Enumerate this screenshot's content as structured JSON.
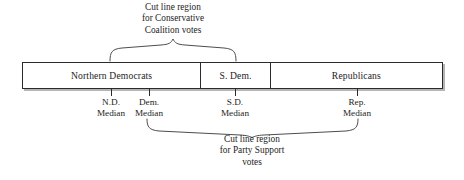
{
  "figure": {
    "type": "legislative-chamber-diagram",
    "background_color": "#ffffff",
    "line_color": "#2b2b2b",
    "brace_color": "#4d4d4d"
  },
  "captions": {
    "top": {
      "lines": [
        "Cut line region",
        "for Conservative",
        "Coalition votes"
      ],
      "brace": {
        "start_x": 110,
        "end_x": 236,
        "apex_x": 173,
        "direction": "down"
      }
    },
    "bottom": {
      "lines": [
        "Cut line region",
        "for Party Support",
        "votes"
      ],
      "brace": {
        "start_x": 147,
        "end_x": 358,
        "apex_x": 252,
        "direction": "up"
      }
    }
  },
  "bar": {
    "left_x": 22,
    "right_x": 443,
    "top_y": 62,
    "bottom_y": 89,
    "segments": [
      {
        "label": "Northern Democrats",
        "start_x": 22,
        "end_x": 200,
        "width_pct": 42.3
      },
      {
        "label": "S. Dem.",
        "start_x": 200,
        "end_x": 270,
        "width_pct": 16.6
      },
      {
        "label": "Republicans",
        "start_x": 270,
        "end_x": 443,
        "width_pct": 41.1
      }
    ]
  },
  "medians": [
    {
      "name": "nd-median",
      "x": 111,
      "lines": [
        "N.D.",
        "Median"
      ]
    },
    {
      "name": "dem-median",
      "x": 149,
      "lines": [
        "Dem.",
        "Median"
      ]
    },
    {
      "name": "sd-median",
      "x": 235,
      "lines": [
        "S.D.",
        "Median"
      ]
    },
    {
      "name": "rep-median",
      "x": 357,
      "lines": [
        "Rep.",
        "Median"
      ]
    }
  ]
}
